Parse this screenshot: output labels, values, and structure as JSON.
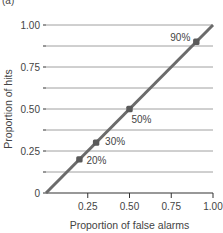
{
  "chart_data": {
    "type": "line",
    "panel_label": "(a)",
    "title": "",
    "xlabel": "Proportion of false alarms",
    "ylabel": "Proportion of hits",
    "xlim": [
      0,
      1
    ],
    "ylim": [
      0,
      1
    ],
    "x_ticks": [
      0.25,
      0.5,
      0.75,
      1.0
    ],
    "x_tick_labels": [
      "0.25",
      "0.50",
      "0.75",
      "1.00"
    ],
    "y_ticks": [
      0,
      0.25,
      0.5,
      0.75,
      1.0
    ],
    "y_tick_labels": [
      "0",
      "0.25",
      "0.50",
      "0.75",
      "1.00"
    ],
    "grid": {
      "horizontal": true,
      "vertical": false,
      "y_lines": [
        0.125,
        0.25,
        0.375,
        0.5,
        0.625,
        0.75,
        0.875,
        1.0
      ]
    },
    "legend": null,
    "series": [
      {
        "name": "ROC (chance diagonal)",
        "line": {
          "x": [
            0,
            1
          ],
          "y": [
            0,
            1
          ]
        },
        "points": [
          {
            "x": 0.2,
            "y": 0.2,
            "label": "20%"
          },
          {
            "x": 0.3,
            "y": 0.3,
            "label": "30%"
          },
          {
            "x": 0.5,
            "y": 0.5,
            "label": "50%"
          },
          {
            "x": 0.9,
            "y": 0.9,
            "label": "90%"
          }
        ]
      }
    ],
    "colors": {
      "line": "#6b6b6b",
      "points": "#5a5a5a",
      "grid": "#a0a0a0",
      "axis": "#333333",
      "text": "#444444"
    }
  }
}
